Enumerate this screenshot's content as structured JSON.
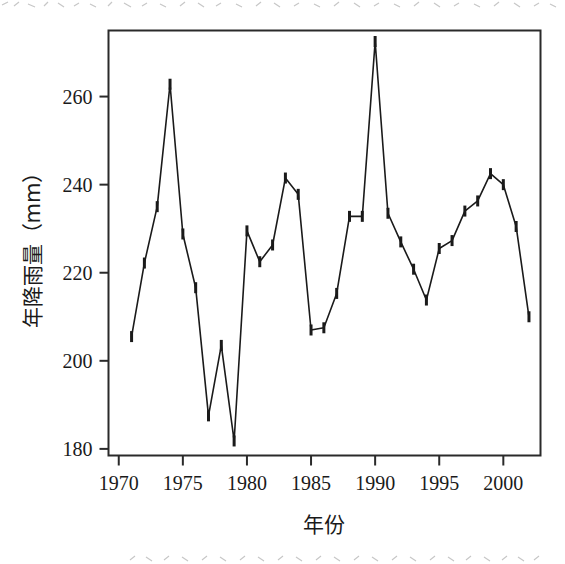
{
  "chart_data": {
    "type": "line",
    "title": "",
    "xlabel": "年份",
    "ylabel": "年降雨量（mm）",
    "xlim": [
      1969.2,
      2002.9
    ],
    "ylim": [
      178.5,
      275
    ],
    "xticks": [
      1970,
      1975,
      1980,
      1985,
      1990,
      1995,
      2000
    ],
    "xtick_labels": [
      "1970",
      "1975",
      "1980",
      "1985",
      "1990",
      "1995",
      "2000"
    ],
    "yticks": [
      180,
      200,
      220,
      240,
      260
    ],
    "ytick_labels": [
      "180",
      "200",
      "220",
      "240",
      "260"
    ],
    "grid": false,
    "legend": false,
    "marker": "vertical-tick",
    "line_color": "#1a1a1a",
    "marker_color": "#1a1a1a",
    "x": [
      1971,
      1972,
      1973,
      1974,
      1975,
      1976,
      1977,
      1978,
      1979,
      1980,
      1981,
      1982,
      1983,
      1984,
      1985,
      1986,
      1987,
      1988,
      1989,
      1990,
      1991,
      1992,
      1993,
      1994,
      1995,
      1996,
      1997,
      1998,
      1999,
      2000,
      2001,
      2002
    ],
    "values": [
      205.5,
      222.2,
      235.0,
      262.8,
      228.8,
      216.6,
      187.5,
      203.5,
      181.8,
      229.5,
      222.5,
      226.3,
      241.5,
      237.8,
      207.0,
      207.5,
      215.3,
      232.8,
      232.8,
      272.5,
      233.5,
      227.0,
      220.8,
      213.8,
      225.5,
      227.3,
      234.0,
      236.3,
      242.5,
      240.0,
      230.5,
      210.0
    ],
    "series_name": "年降雨量"
  },
  "figure": {
    "axis_line_color": "#2a2a2a",
    "background": "#ffffff"
  }
}
